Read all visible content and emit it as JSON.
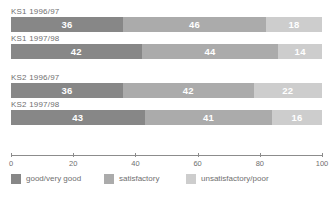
{
  "chart_data": {
    "type": "bar",
    "subtype": "stacked-horizontal-100",
    "title": "",
    "xlabel": "",
    "ylabel": "",
    "xlim": [
      0,
      100
    ],
    "xticks": [
      0,
      20,
      40,
      60,
      80,
      100
    ],
    "xtick_labels": [
      "0",
      "20",
      "40",
      "60",
      "80",
      "100"
    ],
    "grid": false,
    "legend_position": "bottom-left",
    "categories": [
      "KS1 1996/97",
      "KS1 1997/98",
      "KS2 1996/97",
      "KS2 1997/98"
    ],
    "series": [
      {
        "name": "good/very good",
        "color": "#878787",
        "values": [
          36,
          42,
          36,
          43
        ]
      },
      {
        "name": "satisfactory",
        "color": "#ababab",
        "values": [
          46,
          44,
          42,
          41
        ]
      },
      {
        "name": "unsatisfactory/poor",
        "color": "#cdcdcd",
        "values": [
          18,
          14,
          22,
          16
        ]
      }
    ],
    "groups": [
      {
        "rows": [
          {
            "label": "KS1 1996/97",
            "segments": [
              {
                "series": "good/very good",
                "value": 36,
                "label": "36",
                "color": "#878787"
              },
              {
                "series": "satisfactory",
                "value": 46,
                "label": "46",
                "color": "#ababab"
              },
              {
                "series": "unsatisfactory/poor",
                "value": 18,
                "label": "18",
                "color": "#cdcdcd"
              }
            ]
          },
          {
            "label": "KS1 1997/98",
            "segments": [
              {
                "series": "good/very good",
                "value": 42,
                "label": "42",
                "color": "#878787"
              },
              {
                "series": "satisfactory",
                "value": 44,
                "label": "44",
                "color": "#ababab"
              },
              {
                "series": "unsatisfactory/poor",
                "value": 14,
                "label": "14",
                "color": "#cdcdcd"
              }
            ]
          }
        ]
      },
      {
        "rows": [
          {
            "label": "KS2 1996/97",
            "segments": [
              {
                "series": "good/very good",
                "value": 36,
                "label": "36",
                "color": "#878787"
              },
              {
                "series": "satisfactory",
                "value": 42,
                "label": "42",
                "color": "#ababab"
              },
              {
                "series": "unsatisfactory/poor",
                "value": 22,
                "label": "22",
                "color": "#cdcdcd"
              }
            ]
          },
          {
            "label": "KS2 1997/98",
            "segments": [
              {
                "series": "good/very good",
                "value": 43,
                "label": "43",
                "color": "#878787"
              },
              {
                "series": "satisfactory",
                "value": 41,
                "label": "41",
                "color": "#ababab"
              },
              {
                "series": "unsatisfactory/poor",
                "value": 16,
                "label": "16",
                "color": "#cdcdcd"
              }
            ]
          }
        ]
      }
    ],
    "legend": [
      {
        "label": "good/very good",
        "color": "#878787",
        "x": 0
      },
      {
        "label": "satisfactory",
        "color": "#ababab",
        "x": 93
      },
      {
        "label": "unsatisfactory/poor",
        "color": "#cdcdcd",
        "x": 175
      }
    ],
    "axis_color": "#8c8c8c",
    "value_label_color": "#ffffff",
    "text_color": "#6f6f6f"
  }
}
